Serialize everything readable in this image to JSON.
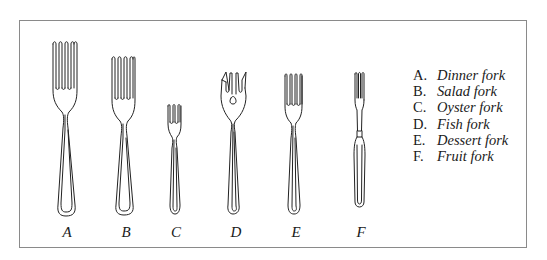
{
  "figure": {
    "border_color": "#8a8a8a",
    "line_color": "#222222"
  },
  "forks": [
    {
      "letter": "A",
      "name": "Dinner fork",
      "cx": 65,
      "top": 41,
      "bottom": 215,
      "tines": 4,
      "style": "standard"
    },
    {
      "letter": "B",
      "name": "Salad fork",
      "cx": 123,
      "top": 56,
      "bottom": 214,
      "tines": 4,
      "style": "standard"
    },
    {
      "letter": "C",
      "name": "Oyster fork",
      "cx": 174,
      "top": 104,
      "bottom": 214,
      "tines": 3,
      "style": "standard"
    },
    {
      "letter": "D",
      "name": "Fish fork",
      "cx": 233,
      "top": 72,
      "bottom": 214,
      "tines": 4,
      "style": "fish"
    },
    {
      "letter": "E",
      "name": "Dessert fork",
      "cx": 293,
      "top": 73,
      "bottom": 214,
      "tines": 4,
      "style": "standard"
    },
    {
      "letter": "F",
      "name": "Fruit fork",
      "cx": 359,
      "top": 72,
      "bottom": 206,
      "tines": 3,
      "style": "fruit"
    }
  ],
  "labels": {
    "a": "A",
    "b": "B",
    "c": "C",
    "d": "D",
    "e": "E",
    "f": "F"
  },
  "legend": {
    "items": [
      {
        "letter": "A.",
        "name": "Dinner fork"
      },
      {
        "letter": "B.",
        "name": "Salad fork"
      },
      {
        "letter": "C.",
        "name": "Oyster fork"
      },
      {
        "letter": "D.",
        "name": "Fish fork"
      },
      {
        "letter": "E.",
        "name": "Dessert fork"
      },
      {
        "letter": "F.",
        "name": "Fruit fork"
      }
    ]
  }
}
